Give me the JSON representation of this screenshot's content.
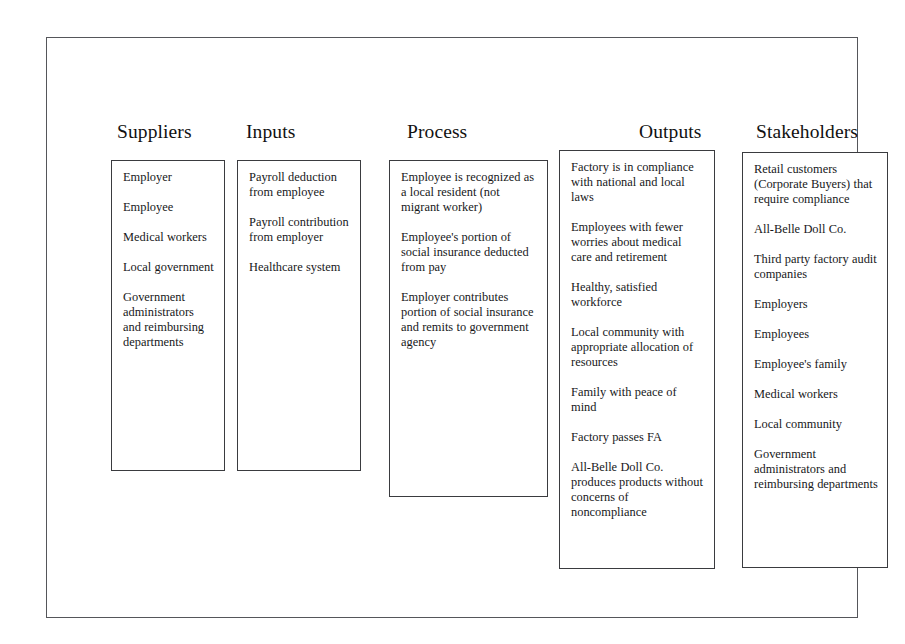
{
  "diagram": {
    "type": "SIPOC",
    "columns": [
      {
        "id": "suppliers",
        "title": "Suppliers",
        "items": [
          "Employer",
          "Employee",
          "Medical workers",
          "Local government",
          "Government administrators and reimbursing departments"
        ]
      },
      {
        "id": "inputs",
        "title": "Inputs",
        "items": [
          "Payroll deduction from employee",
          "Payroll contribution from employer",
          "Healthcare system"
        ]
      },
      {
        "id": "process",
        "title": "Process",
        "items": [
          "Employee is recognized as a local resident (not migrant worker)",
          "Employee's portion of social insurance deducted from pay",
          "Employer contributes portion of social insurance and remits to government agency"
        ]
      },
      {
        "id": "outputs",
        "title": "Outputs",
        "items": [
          "Factory is in compliance with national and local laws",
          "Employees with fewer worries about medical care and retirement",
          "Healthy, satisfied workforce",
          "Local community with appropriate allocation of resources",
          "Family with peace of mind",
          "Factory passes FA",
          "All-Belle Doll Co. produces products without concerns of noncompliance"
        ]
      },
      {
        "id": "stakeholders",
        "title": "Stakeholders",
        "items": [
          "Retail customers (Corporate Buyers) that require compliance",
          "All-Belle Doll Co.",
          "Third party factory audit companies",
          "Employers",
          "Employees",
          "Employee's family",
          "Medical workers",
          "Local community",
          "Government administrators and reimbursing departments"
        ]
      }
    ],
    "colors": {
      "frame_border": "#55565a",
      "box_border": "#3a3b3f",
      "text": "#17181a",
      "background": "#ffffff"
    }
  }
}
